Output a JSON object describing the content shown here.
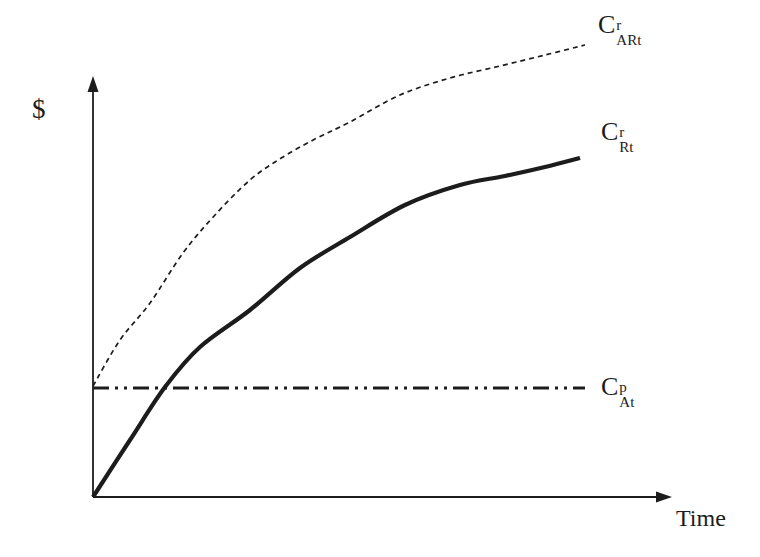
{
  "figure": {
    "background": "#ffffff",
    "ink": "#1c1c1c",
    "width": 760,
    "height": 557,
    "y_axis_label": "$",
    "x_axis_label": "Time",
    "labels": [
      {
        "id": "label-c-art",
        "base": "C",
        "sup": "r",
        "sub": "ARt"
      },
      {
        "id": "label-c-rt",
        "base": "C",
        "sup": "r",
        "sub": "Rt"
      },
      {
        "id": "label-c-at",
        "base": "C",
        "sup": "p",
        "sub": "At"
      }
    ]
  },
  "chart_data": {
    "type": "line",
    "title": "",
    "xlabel": "Time",
    "ylabel": "$",
    "axes": {
      "ticks": false,
      "grid": false,
      "arrows": true,
      "origin_px": [
        93,
        497
      ],
      "y_tip_px": [
        93,
        76
      ],
      "x_tip_px": [
        672,
        497
      ],
      "stroke_width": 1.8
    },
    "xlim": [
      0,
      10
    ],
    "ylim": [
      0,
      100
    ],
    "legend_position": "labels-at-line-ends",
    "series": [
      {
        "id": "curve-c-art",
        "name": "C^r_ARt (cumulative rental cost, asset A rented)",
        "line_style": "dashed",
        "dash": "5 4",
        "width": 1.7,
        "x": [
          0.0,
          0.5,
          1.0,
          1.6,
          2.2,
          2.8,
          3.4,
          4.0,
          4.5,
          5.4,
          6.3,
          7.2,
          8.0,
          8.7
        ],
        "y": [
          24.6,
          34.7,
          42.9,
          54.0,
          62.4,
          70.1,
          75.2,
          79.4,
          83.0,
          88.9,
          92.7,
          95.4,
          97.8,
          100.0
        ],
        "points_px": [
          [
            93,
            386
          ],
          [
            120,
            340
          ],
          [
            150,
            303
          ],
          [
            183,
            253
          ],
          [
            215,
            215
          ],
          [
            250,
            180
          ],
          [
            283,
            157
          ],
          [
            317,
            138
          ],
          [
            350,
            122
          ],
          [
            400,
            95
          ],
          [
            450,
            78
          ],
          [
            500,
            66
          ],
          [
            545,
            55
          ],
          [
            585,
            45
          ]
        ]
      },
      {
        "id": "curve-c-rt",
        "name": "C^r_Rt (cumulative rental cost)",
        "line_style": "solid",
        "dash": null,
        "width": 4.2,
        "x": [
          0.0,
          0.7,
          1.3,
          1.9,
          2.8,
          3.7,
          4.5,
          5.5,
          6.5,
          7.3,
          8.0,
          8.6
        ],
        "y": [
          0.0,
          12.6,
          24.3,
          33.2,
          41.4,
          50.7,
          57.5,
          64.6,
          69.0,
          71.0,
          73.0,
          75.0
        ],
        "points_px": [
          [
            93,
            497
          ],
          [
            130,
            440
          ],
          [
            165,
            387
          ],
          [
            200,
            347
          ],
          [
            250,
            310
          ],
          [
            300,
            268
          ],
          [
            350,
            237
          ],
          [
            405,
            205
          ],
          [
            460,
            185
          ],
          [
            505,
            176
          ],
          [
            545,
            167
          ],
          [
            580,
            158
          ]
        ]
      },
      {
        "id": "line-c-at",
        "name": "C^p_At (one-time purchase price, constant)",
        "line_style": "dash-dot-dot",
        "dash": "16 6 3 6 3 6",
        "width": 3.2,
        "x": [
          0.0,
          8.7
        ],
        "y": [
          24.1,
          24.1
        ],
        "points_px": [
          [
            93,
            388
          ],
          [
            585,
            388
          ]
        ]
      }
    ]
  }
}
